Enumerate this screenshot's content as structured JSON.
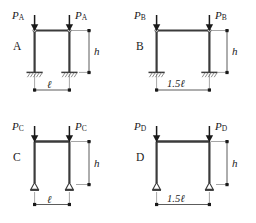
{
  "figure": {
    "colors": {
      "member": "#3b3b3b",
      "dimension": "#4a4a4a",
      "text": "#1a1a1a",
      "background": "#ffffff"
    }
  },
  "frames": [
    {
      "id": "A",
      "letter": "A",
      "load_label": "P",
      "load_subscript": "A",
      "left_load_label": "P",
      "right_load_label": "P",
      "height_label": "h",
      "span_label": "ℓ",
      "span_value": "1.0",
      "support_type": "fixed",
      "support_name": "fixed-support"
    },
    {
      "id": "B",
      "letter": "B",
      "load_label": "P",
      "load_subscript": "B",
      "left_load_label": "P",
      "right_load_label": "P",
      "height_label": "h",
      "span_label": "1.5ℓ",
      "span_value": "1.5",
      "support_type": "fixed",
      "support_name": "fixed-support"
    },
    {
      "id": "C",
      "letter": "C",
      "load_label": "P",
      "load_subscript": "C",
      "left_load_label": "P",
      "right_load_label": "P",
      "height_label": "h",
      "span_label": "ℓ",
      "span_value": "1.0",
      "support_type": "pinned",
      "support_name": "pinned-support"
    },
    {
      "id": "D",
      "letter": "D",
      "load_label": "P",
      "load_subscript": "D",
      "left_load_label": "P",
      "right_load_label": "P",
      "height_label": "h",
      "span_label": "1.5ℓ",
      "span_value": "1.5",
      "support_type": "pinned",
      "support_name": "pinned-support"
    }
  ]
}
